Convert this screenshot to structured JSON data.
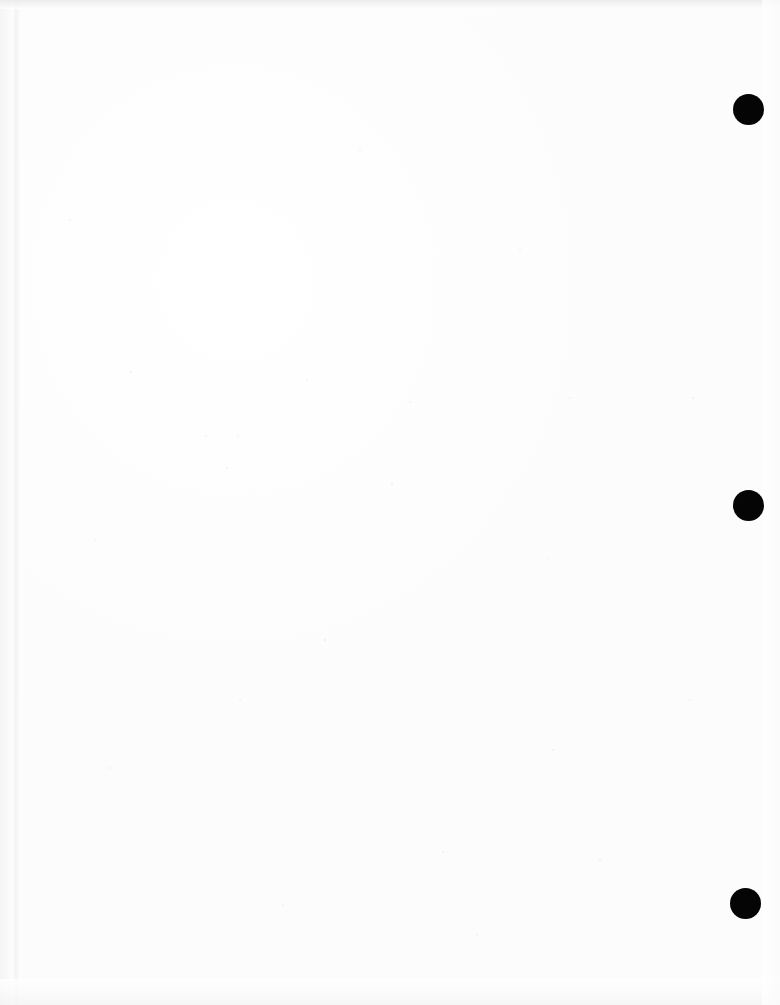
{
  "page": {
    "kind": "scanned-document-page",
    "width_px": 780,
    "height_px": 1005,
    "background_color": "#ffffff",
    "content_text": ""
  },
  "marks": {
    "color": "#050505",
    "items": [
      {
        "name": "registration-mark-top",
        "cx": 748,
        "cy": 109,
        "d": 31
      },
      {
        "name": "registration-mark-middle",
        "cx": 748,
        "cy": 505,
        "d": 31
      },
      {
        "name": "registration-mark-bottom",
        "cx": 745,
        "cy": 903,
        "d": 31
      }
    ]
  },
  "artifacts": {
    "top_edge_color": "#e9e9ea",
    "left_seam_color": "#f2f2f4",
    "bottom_edge_color": "#f4f4f5",
    "right_edge_color": "#fbfbfc"
  }
}
